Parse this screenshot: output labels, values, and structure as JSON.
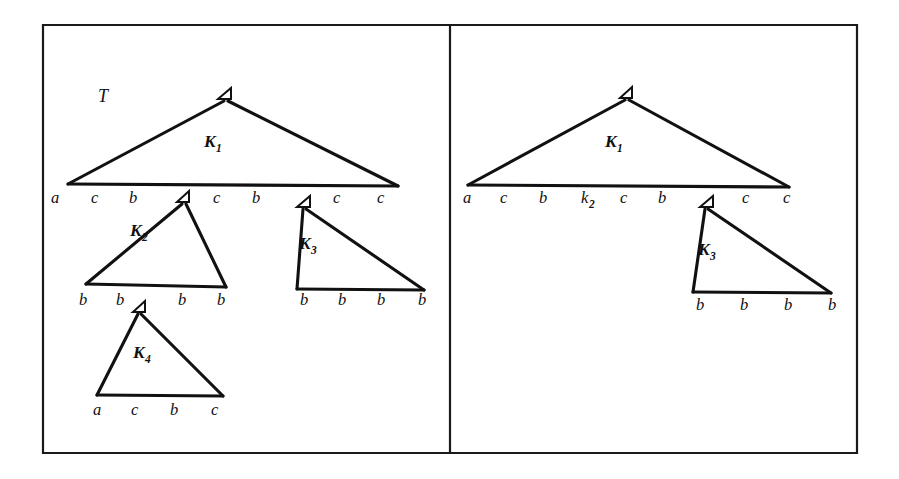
{
  "figure": {
    "background_color": "#ffffff",
    "ink_color": "#111111",
    "frame": {
      "outer_border": "rectangle",
      "divider": "vertical-line",
      "panel_count": 2
    }
  },
  "panels": [
    {
      "id": "left-panel",
      "name": "full-tree-panel",
      "tree_label": "T",
      "triangles": [
        {
          "id": "left-K1",
          "label": "K",
          "subscript": "1",
          "apex_marker": "small-triangle-node",
          "frontier": [
            "a",
            "c",
            "b",
            "c",
            "b",
            "c",
            "c"
          ]
        },
        {
          "id": "left-K2",
          "label": "K",
          "subscript": "2",
          "apex_marker": "small-triangle-node",
          "frontier": [
            "b",
            "b",
            "b",
            "b"
          ]
        },
        {
          "id": "left-K3",
          "label": "K",
          "subscript": "3",
          "apex_marker": "small-triangle-node",
          "frontier": [
            "b",
            "b",
            "b",
            "b"
          ]
        },
        {
          "id": "left-K4",
          "label": "K",
          "subscript": "4",
          "apex_marker": "small-triangle-node",
          "frontier": [
            "a",
            "c",
            "b",
            "c"
          ]
        }
      ],
      "frontier_rows": [
        {
          "id": "left-row-1",
          "symbols": [
            "a",
            "c",
            "b",
            "c",
            "b",
            "c",
            "c"
          ]
        },
        {
          "id": "left-row-2",
          "symbols": [
            "b",
            "b",
            "b",
            "b",
            "b",
            "b",
            "b",
            "b"
          ]
        },
        {
          "id": "left-row-3",
          "symbols": [
            "a",
            "c",
            "b",
            "c"
          ]
        }
      ]
    },
    {
      "id": "right-panel",
      "name": "pruned-tree-panel",
      "tree_label": "",
      "triangles": [
        {
          "id": "right-K1",
          "label": "K",
          "subscript": "1",
          "apex_marker": "small-triangle-node",
          "frontier": [
            "a",
            "c",
            "b",
            "k2",
            "c",
            "b",
            "c",
            "c"
          ]
        },
        {
          "id": "right-K3",
          "label": "K",
          "subscript": "3",
          "apex_marker": "small-triangle-node",
          "frontier": [
            "b",
            "b",
            "b",
            "b"
          ]
        }
      ],
      "frontier_rows": [
        {
          "id": "right-row-1",
          "symbols": [
            "a",
            "c",
            "b",
            "k2",
            "c",
            "b",
            "c",
            "c"
          ]
        },
        {
          "id": "right-row-2",
          "symbols": [
            "b",
            "b",
            "b",
            "b"
          ]
        }
      ]
    }
  ],
  "labels": {
    "tree_T": "T",
    "K_letter": "K",
    "k_letter_lower": "k",
    "sub_1": "1",
    "sub_2": "2",
    "sub_3": "3",
    "sub_4": "4",
    "terminal_a": "a",
    "terminal_b": "b",
    "terminal_c": "c"
  },
  "left_panel_text": {
    "tree": "T",
    "k1_base": "K",
    "k1_sub": "1",
    "k2_base": "K",
    "k2_sub": "2",
    "k3_base": "K",
    "k3_sub": "3",
    "k4_base": "K",
    "k4_sub": "4",
    "row1": [
      "a",
      "c",
      "b",
      "c",
      "b",
      "c",
      "c"
    ],
    "row2_left": [
      "b",
      "b",
      "b",
      "b"
    ],
    "row2_right": [
      "b",
      "b",
      "b",
      "b"
    ],
    "row3": [
      "a",
      "c",
      "b",
      "c"
    ]
  },
  "right_panel_text": {
    "k1_base": "K",
    "k1_sub": "1",
    "k3_base": "K",
    "k3_sub": "3",
    "row1": [
      "a",
      "c",
      "b",
      "k",
      "c",
      "b",
      "c",
      "c"
    ],
    "row1_nonterminal_sub": "2",
    "row2": [
      "b",
      "b",
      "b",
      "b"
    ]
  }
}
